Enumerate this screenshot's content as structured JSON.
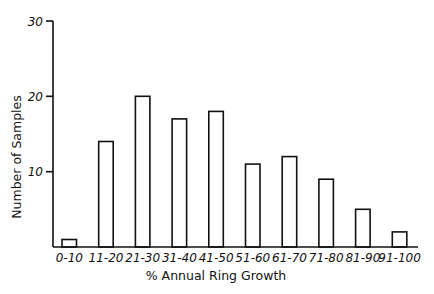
{
  "chart_data": {
    "type": "bar",
    "title": "",
    "xlabel": "% Annual Ring Growth",
    "ylabel": "Number of Samples",
    "categories": [
      "0-10",
      "11-20",
      "21-30",
      "31-40",
      "41-50",
      "51-60",
      "61-70",
      "71-80",
      "81-90",
      "91-100"
    ],
    "values": [
      1,
      14,
      20,
      17,
      18,
      11,
      12,
      9,
      5,
      2
    ],
    "ylim": [
      0,
      30
    ],
    "yticks": [
      10,
      20,
      30
    ],
    "grid": false,
    "legend": null,
    "bar_fill": "#ffffff",
    "bar_stroke": "#111111"
  }
}
